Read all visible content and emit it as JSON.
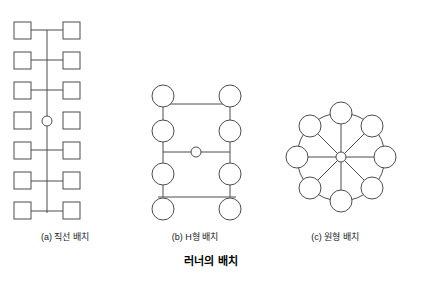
{
  "figure": {
    "main_caption": "러너의 배치",
    "panels": [
      {
        "id": "a",
        "caption": "(a) 직선 배치",
        "layout_type": "straight-line",
        "node_count": 12,
        "node_shape": "square",
        "hub_shape": "circle"
      },
      {
        "id": "b",
        "caption": "(b) H형 배치",
        "layout_type": "h-shape",
        "node_count": 8,
        "node_shape": "circle",
        "hub_shape": "circle"
      },
      {
        "id": "c",
        "caption": "(c) 원형 배치",
        "layout_type": "circular",
        "node_count": 8,
        "node_shape": "circle",
        "hub_shape": "circle"
      }
    ],
    "colors": {
      "stroke": "#4d4d4d",
      "node_fill": "#ffffff",
      "background": "#ffffff",
      "text": "#000000"
    }
  }
}
